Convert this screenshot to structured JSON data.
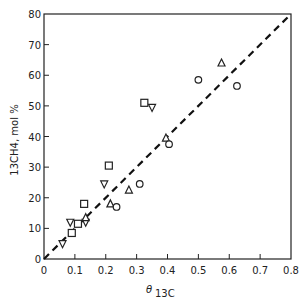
{
  "chart_data": {
    "type": "scatter",
    "title": "",
    "xlabel": "θ 13C",
    "xlabel_main": "θ",
    "xlabel_sub": "13C",
    "ylabel": "13CH4, mol %",
    "xlim": [
      0,
      0.8
    ],
    "ylim": [
      0,
      80
    ],
    "x_ticks": [
      0,
      0.1,
      0.2,
      0.3,
      0.4,
      0.5,
      0.6,
      0.7,
      0.8
    ],
    "x_tick_labels": [
      "0",
      "0.1",
      "0.2",
      "0.3",
      "0.4",
      "0.5",
      "0.6",
      "0.7",
      "0.8"
    ],
    "y_ticks": [
      0,
      10,
      20,
      30,
      40,
      50,
      60,
      70,
      80
    ],
    "y_tick_labels": [
      "0",
      "10",
      "20",
      "30",
      "40",
      "50",
      "60",
      "70",
      "80"
    ],
    "grid": false,
    "legend": null,
    "reference_line": {
      "style": "dashed",
      "from": [
        0,
        0
      ],
      "to": [
        0.8,
        80
      ],
      "label": "y = 100·x (1:1 line)"
    },
    "series": [
      {
        "name": "squares",
        "marker": "square",
        "points": [
          [
            0.09,
            8.5
          ],
          [
            0.11,
            11.5
          ],
          [
            0.13,
            18
          ],
          [
            0.21,
            30.5
          ],
          [
            0.325,
            51
          ]
        ]
      },
      {
        "name": "down-triangles",
        "marker": "triangle-down",
        "points": [
          [
            0.06,
            5
          ],
          [
            0.085,
            12
          ],
          [
            0.135,
            12
          ],
          [
            0.195,
            24.5
          ],
          [
            0.35,
            49.5
          ]
        ]
      },
      {
        "name": "up-triangles",
        "marker": "triangle-up",
        "points": [
          [
            0.135,
            13.5
          ],
          [
            0.215,
            18
          ],
          [
            0.275,
            22.5
          ],
          [
            0.395,
            39.5
          ],
          [
            0.575,
            64
          ]
        ]
      },
      {
        "name": "circles",
        "marker": "circle",
        "points": [
          [
            0.235,
            17
          ],
          [
            0.31,
            24.5
          ],
          [
            0.405,
            37.5
          ],
          [
            0.5,
            58.5
          ],
          [
            0.625,
            56.5
          ]
        ]
      }
    ]
  }
}
